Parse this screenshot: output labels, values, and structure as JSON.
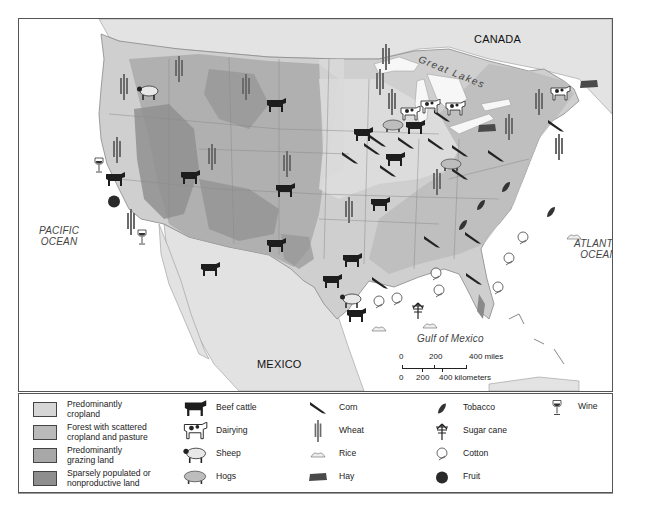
{
  "map": {
    "labels": {
      "canada": "CANADA",
      "great_lakes": "Great Lakes",
      "pacific": "PACIFIC OCEAN",
      "pacific_line1": "PACIFIC",
      "pacific_line2": "OCEAN",
      "atlantic_line1": "ATLANTIC",
      "atlantic_line2": "OCEAN",
      "gulf": "Gulf of Mexico",
      "mexico": "MEXICO"
    },
    "colors": {
      "cropland": "#d9d9d9",
      "forest": "#bdbdbd",
      "grazing": "#a9a9a9",
      "sparse": "#8f8f8f",
      "water": "#ffffff",
      "foreign_land": "#e6e6e6"
    },
    "scale_bar": {
      "miles_ticks": [
        "0",
        "200",
        "400 miles"
      ],
      "km_ticks": [
        "0",
        "200",
        "400 kilometers"
      ]
    }
  },
  "legend": {
    "land_use": [
      {
        "label_line1": "Predominantly",
        "label_line2": "cropland",
        "color": "#d6d6d6"
      },
      {
        "label_line1": "Forest with scattered",
        "label_line2": "cropland and pasture",
        "color": "#bababa"
      },
      {
        "label_line1": "Predominantly",
        "label_line2": "grazing land",
        "color": "#a8a8a8"
      },
      {
        "label_line1": "Sparsely populated or",
        "label_line2": "nonproductive land",
        "color": "#8e8e8e"
      }
    ],
    "livestock": [
      {
        "icon": "beef-cattle-icon",
        "label": "Beef cattle"
      },
      {
        "icon": "dairy-cow-icon",
        "label": "Dairying"
      },
      {
        "icon": "sheep-icon",
        "label": "Sheep"
      },
      {
        "icon": "hog-icon",
        "label": "Hogs"
      }
    ],
    "grains": [
      {
        "icon": "corn-icon",
        "label": "Corn"
      },
      {
        "icon": "wheat-icon",
        "label": "Wheat"
      },
      {
        "icon": "rice-icon",
        "label": "Rice"
      },
      {
        "icon": "hay-icon",
        "label": "Hay"
      }
    ],
    "other_crops": [
      {
        "icon": "tobacco-icon",
        "label": "Tobacco"
      },
      {
        "icon": "sugar-cane-icon",
        "label": "Sugar cane"
      },
      {
        "icon": "cotton-icon",
        "label": "Cotton"
      },
      {
        "icon": "fruit-icon",
        "label": "Fruit"
      }
    ],
    "beverages": [
      {
        "icon": "wine-icon",
        "label": "Wine"
      }
    ]
  }
}
